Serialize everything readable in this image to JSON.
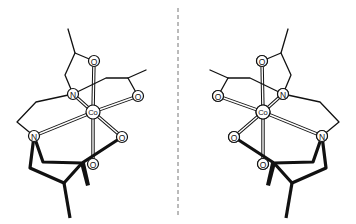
{
  "figure": {
    "mirror_line": {
      "x": 178,
      "style": "dashed",
      "color": "#777777"
    },
    "atoms": {
      "metal": "Co",
      "nitrogen": "N",
      "oxygen": "O"
    },
    "molecules": [
      {
        "name": "left-enantiomer",
        "center_label": "Co"
      },
      {
        "name": "right-enantiomer",
        "center_label": "Co"
      }
    ]
  }
}
